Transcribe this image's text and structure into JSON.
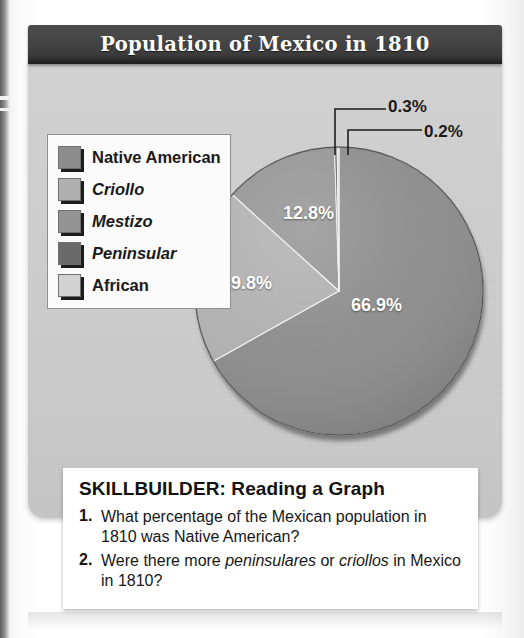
{
  "figure": {
    "title": "Population of Mexico in 1810"
  },
  "legend": {
    "items": [
      {
        "label": "Native American",
        "color": "#8c8c8c",
        "italic": false
      },
      {
        "label": "Criollo",
        "color": "#b0b0b0",
        "italic": true
      },
      {
        "label": "Mestizo",
        "color": "#949494",
        "italic": true
      },
      {
        "label": "Peninsular",
        "color": "#6a6a6a",
        "italic": true
      },
      {
        "label": "African",
        "color": "#d2d2d2",
        "italic": false
      }
    ]
  },
  "callouts": {
    "peninsular": "0.3%",
    "african": "0.2%"
  },
  "slice_labels": {
    "native_american": "66.9%",
    "criollo": "19.8%",
    "mestizo": "12.8%"
  },
  "skillbuilder": {
    "heading": "SKILLBUILDER: Reading a Graph",
    "questions": [
      {
        "number": "1.",
        "parts": [
          {
            "text": "What percentage of the Mexican population in 1810 was Native American?",
            "italic": false
          }
        ]
      },
      {
        "number": "2.",
        "parts": [
          {
            "text": "Were there more ",
            "italic": false
          },
          {
            "text": "peninsulares",
            "italic": true
          },
          {
            "text": " or ",
            "italic": false
          },
          {
            "text": "criollos",
            "italic": true
          },
          {
            "text": " in Mexico in 1810?",
            "italic": false
          }
        ]
      }
    ]
  },
  "chart_data": {
    "type": "pie",
    "title": "Population of Mexico in 1810",
    "xlabel": "",
    "ylabel": "",
    "categories": [
      "Native American",
      "Criollo",
      "Mestizo",
      "Peninsular",
      "African"
    ],
    "values": [
      66.9,
      19.8,
      12.8,
      0.3,
      0.2
    ],
    "value_labels": [
      "66.9%",
      "19.8%",
      "12.8%",
      "0.3%",
      "0.2%"
    ],
    "colors": [
      "#8c8c8c",
      "#b0b0b0",
      "#949494",
      "#6a6a6a",
      "#d2d2d2"
    ],
    "label_placement": [
      "inside",
      "inside",
      "inside",
      "leader-line",
      "leader-line"
    ],
    "start_angle_deg": 0,
    "direction": "clockwise",
    "units": "percent",
    "legend_position": "left",
    "grid": false
  }
}
